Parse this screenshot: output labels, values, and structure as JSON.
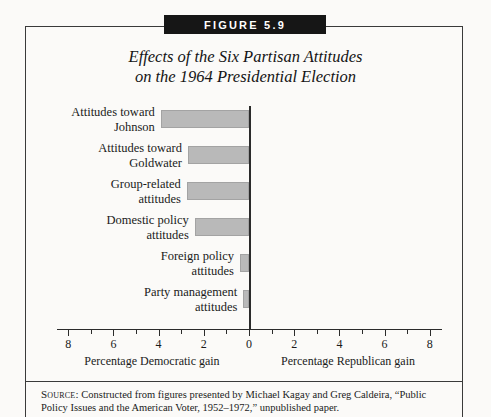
{
  "figure": {
    "badge": "FIGURE 5.9",
    "title_line1": "Effects of the Six Partisan Attitudes",
    "title_line2": "on the 1964 Presidential Election",
    "source_label": "Source:",
    "source_text": "Constructed from figures presented by Michael Kagay and Greg Caldeira, “Public Policy Issues and the American Voter, 1952–1972,” unpublished paper."
  },
  "axis": {
    "left_caption": "Percentage Democratic gain",
    "right_caption": "Percentage Republican gain",
    "tick_labels": [
      "8",
      "6",
      "4",
      "2",
      "0",
      "2",
      "4",
      "6",
      "8"
    ],
    "tick_values": [
      -8,
      -6,
      -4,
      -2,
      0,
      2,
      4,
      6,
      8
    ]
  },
  "bars": [
    {
      "label_line1": "Attitudes toward",
      "label_line2": "Johnson",
      "value": 3.9
    },
    {
      "label_line1": "Attitudes toward",
      "label_line2": "Goldwater",
      "value": 2.7
    },
    {
      "label_line1": "Group-related",
      "label_line2": "attitudes",
      "value": 2.75
    },
    {
      "label_line1": "Domestic policy",
      "label_line2": "attitudes",
      "value": 2.4
    },
    {
      "label_line1": "Foreign policy",
      "label_line2": "attitudes",
      "value": 0.4
    },
    {
      "label_line1": "Party management",
      "label_line2": "attitudes",
      "value": 0.25
    }
  ],
  "colors": {
    "bar_fill": "#b9b9b9",
    "bar_stroke": "#a3a3a3",
    "axis": "#2b2b2b",
    "badge_bg": "#161616",
    "badge_text": "#ffffff"
  },
  "chart_data": {
    "type": "bar",
    "orientation": "horizontal",
    "title": "Effects of the Six Partisan Attitudes on the 1964 Presidential Election",
    "xlabel": "Percentage Democratic gain / Percentage Republican gain",
    "ylabel": "",
    "categories": [
      "Attitudes toward Johnson",
      "Attitudes toward Goldwater",
      "Group-related attitudes",
      "Domestic policy attitudes",
      "Foreign policy attitudes",
      "Party management attitudes"
    ],
    "values": [
      3.9,
      2.7,
      2.75,
      2.4,
      0.4,
      0.25
    ],
    "value_units": "percentage points of Democratic gain",
    "direction": "all bars extend left of zero (Democratic gain)",
    "xlim": [
      -8,
      8
    ],
    "xticks": [
      -8,
      -6,
      -4,
      -2,
      0,
      2,
      4,
      6,
      8
    ],
    "xticklabels": [
      "8",
      "6",
      "4",
      "2",
      "0",
      "2",
      "4",
      "6",
      "8"
    ],
    "minor_ticks": true,
    "grid": false,
    "legend": "none",
    "zero_line": true
  }
}
